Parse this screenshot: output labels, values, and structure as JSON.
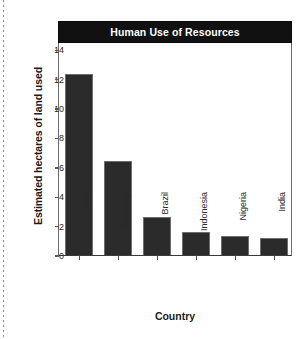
{
  "chart_data": {
    "type": "bar",
    "title": "Human Use of Resources",
    "xlabel": "Country",
    "ylabel": "Estimated hectares of land used",
    "categories": [
      "USA",
      "Germany",
      "Brazil",
      "Indonesia",
      "Nigeria",
      "India"
    ],
    "values": [
      12.3,
      6.4,
      2.6,
      1.6,
      1.3,
      1.15
    ],
    "yticks": [
      0,
      2,
      4,
      6,
      8,
      10,
      12,
      14
    ],
    "ylim": [
      0,
      14.5
    ],
    "grid": false,
    "legend": false,
    "bar_color": "#2b2b2b",
    "title_banner_color": "#111111",
    "title_text_color": "#ffffff"
  }
}
